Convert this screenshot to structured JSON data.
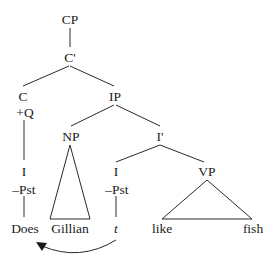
{
  "diagram": {
    "type": "syntax-tree",
    "nodes": {
      "cp": "CP",
      "c_bar": "C'",
      "c": "C",
      "c_feature": "+Q",
      "ip": "IP",
      "np": "NP",
      "i_bar": "I'",
      "moved_i": "I",
      "moved_i_feature": "–Pst",
      "moved_word": "Does",
      "np_word": "Gillian",
      "trace_i": "I",
      "trace_i_feature": "–Pst",
      "trace": "t",
      "vp": "VP",
      "vp_word_1": "like",
      "vp_word_2": "fish"
    },
    "movement": {
      "from": "t",
      "to": "Does"
    }
  }
}
